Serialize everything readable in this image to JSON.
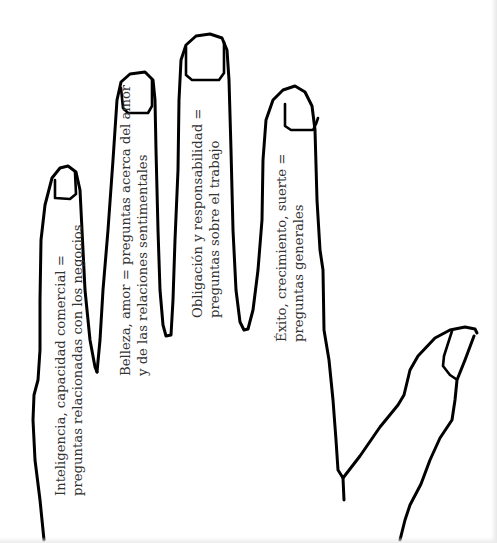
{
  "diagram": {
    "stroke_color": "#000000",
    "text_color": "#333333",
    "background": "#ffffff",
    "fingers": [
      {
        "id": "pinky",
        "line1": "Inteligencia, capacidad comercial =",
        "line2": "preguntas relacionadas con los negocios"
      },
      {
        "id": "ring",
        "line1": "Belleza, amor = preguntas acerca del amor",
        "line2": "y de las relaciones sentimentales"
      },
      {
        "id": "middle",
        "line1": "Obligación y responsabilidad =",
        "line2": "preguntas sobre el trabajo"
      },
      {
        "id": "index",
        "line1": "Éxito, crecimiento, suerte =",
        "line2": "preguntas generales"
      }
    ],
    "thumb": {
      "label": ""
    }
  }
}
